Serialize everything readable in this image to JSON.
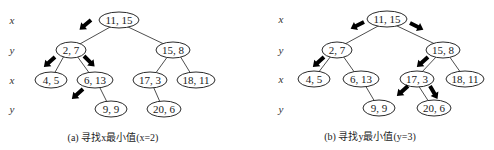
{
  "panels": [
    {
      "id": "a",
      "caption": "(a) 寻找x最小值(x=2)",
      "levels": [
        "x",
        "y",
        "x",
        "y"
      ],
      "nodes": [
        {
          "id": "n1",
          "label": "11, 15"
        },
        {
          "id": "n2",
          "label": "2, 7"
        },
        {
          "id": "n3",
          "label": "15, 8"
        },
        {
          "id": "n4",
          "label": "4, 5"
        },
        {
          "id": "n5",
          "label": "6, 13"
        },
        {
          "id": "n6",
          "label": "17, 3"
        },
        {
          "id": "n7",
          "label": "18, 11"
        },
        {
          "id": "n8",
          "label": "9, 9"
        },
        {
          "id": "n9",
          "label": "20, 6"
        }
      ],
      "edges": [
        [
          "n1",
          "n2"
        ],
        [
          "n1",
          "n3"
        ],
        [
          "n2",
          "n4"
        ],
        [
          "n2",
          "n5"
        ],
        [
          "n3",
          "n6"
        ],
        [
          "n3",
          "n7"
        ],
        [
          "n5",
          "n8"
        ],
        [
          "n6",
          "n9"
        ]
      ],
      "search_arrows": [
        "root→(2, 7)",
        "(2, 7)→(4, 5)",
        "(2, 7)→(6, 13)",
        "(6, 13)→left (empty)"
      ]
    },
    {
      "id": "b",
      "caption": "(b) 寻找y最小值(y=3)",
      "levels": [
        "x",
        "y",
        "x",
        "y"
      ],
      "nodes": [
        {
          "id": "n1",
          "label": "11, 15"
        },
        {
          "id": "n2",
          "label": "2, 7"
        },
        {
          "id": "n3",
          "label": "15, 8"
        },
        {
          "id": "n4",
          "label": "4, 5"
        },
        {
          "id": "n5",
          "label": "6, 13"
        },
        {
          "id": "n6",
          "label": "17, 3"
        },
        {
          "id": "n7",
          "label": "18, 11"
        },
        {
          "id": "n8",
          "label": "9, 9"
        },
        {
          "id": "n9",
          "label": "20, 6"
        }
      ],
      "edges": [
        [
          "n1",
          "n2"
        ],
        [
          "n1",
          "n3"
        ],
        [
          "n2",
          "n4"
        ],
        [
          "n2",
          "n5"
        ],
        [
          "n3",
          "n6"
        ],
        [
          "n3",
          "n7"
        ],
        [
          "n5",
          "n8"
        ],
        [
          "n6",
          "n9"
        ]
      ],
      "search_arrows": [
        "root→(2, 7)",
        "root→(15, 8)",
        "(2, 7)→(4, 5)",
        "(15, 8)→(17, 3)",
        "(17, 3)→left (empty)",
        "(17, 3)→(20, 6)"
      ]
    }
  ]
}
